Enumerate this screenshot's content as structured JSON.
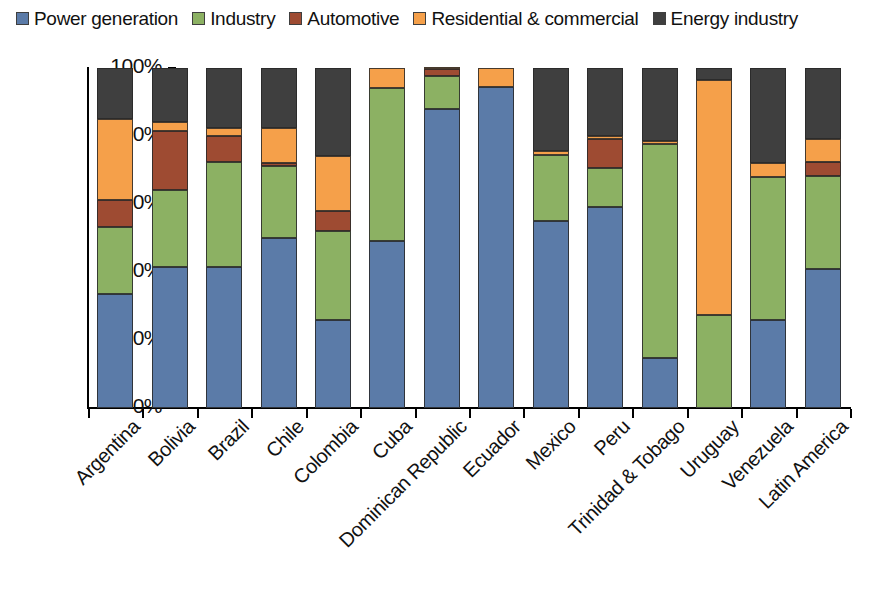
{
  "legend": {
    "position": "top-left",
    "entries": [
      {
        "label": "Power generation",
        "color": "#5b7ba8",
        "icon": "legend-swatch-icon"
      },
      {
        "label": "Industry",
        "color": "#8cb163",
        "icon": "legend-swatch-icon"
      },
      {
        "label": "Automotive",
        "color": "#9e4b32",
        "icon": "legend-swatch-icon"
      },
      {
        "label": "Residential & commercial",
        "color": "#f5a04a",
        "icon": "legend-swatch-icon"
      },
      {
        "label": "Energy industry",
        "color": "#3f3f3f",
        "icon": "legend-swatch-icon"
      }
    ]
  },
  "yaxis": {
    "ticks": [
      "0%",
      "20%",
      "40%",
      "60%",
      "80%",
      "100%"
    ],
    "min": 0,
    "max": 100
  },
  "chart_data": {
    "type": "bar",
    "stacked": true,
    "normalized": true,
    "title": "",
    "xlabel": "",
    "ylabel": "",
    "ylim": [
      0,
      100
    ],
    "grid": false,
    "legend_position": "top",
    "categories": [
      "Argentina",
      "Bolivia",
      "Brazil",
      "Chile",
      "Colombia",
      "Cuba",
      "Dominican Republic",
      "Ecuador",
      "Mexico",
      "Peru",
      "Trinidad & Tobago",
      "Uruguay",
      "Venezuela",
      "Latin America"
    ],
    "series": [
      {
        "name": "Power generation",
        "color": "#5b7ba8",
        "values": [
          33.5,
          41.5,
          41.5,
          50.0,
          25.8,
          49.0,
          87.8,
          94.5,
          55.0,
          59.0,
          14.8,
          0.0,
          26.0,
          41.0
        ]
      },
      {
        "name": "Industry",
        "color": "#8cb163",
        "values": [
          19.8,
          22.5,
          31.0,
          21.2,
          26.2,
          45.0,
          9.8,
          0.0,
          19.5,
          11.5,
          62.8,
          27.5,
          42.0,
          27.2
        ]
      },
      {
        "name": "Automotive",
        "color": "#9e4b32",
        "values": [
          8.0,
          17.5,
          7.5,
          0.8,
          6.0,
          0.0,
          2.0,
          0.0,
          0.0,
          8.5,
          0.0,
          0.0,
          0.0,
          4.3
        ]
      },
      {
        "name": "Residential & commercial",
        "color": "#f5a04a",
        "values": [
          23.7,
          2.5,
          2.5,
          10.5,
          16.0,
          6.0,
          0.4,
          5.5,
          1.0,
          1.0,
          1.0,
          69.0,
          4.0,
          6.5
        ]
      },
      {
        "name": "Energy industry",
        "color": "#3f3f3f",
        "values": [
          15.0,
          16.0,
          17.5,
          17.5,
          26.0,
          0.0,
          0.0,
          0.0,
          24.5,
          20.0,
          21.4,
          3.5,
          28.0,
          21.0
        ]
      }
    ]
  }
}
